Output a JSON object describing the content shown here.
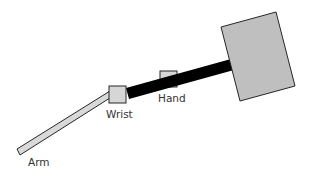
{
  "diagram": {
    "labels": {
      "arm": "Arm",
      "wrist": "Wrist",
      "hand": "Hand"
    },
    "colors": {
      "background": "#ffffff",
      "arm_fill": "#d9d9d9",
      "joint_fill": "#d6d6d6",
      "block_fill": "#bfbfbf",
      "bar_fill": "#000000",
      "stroke": "#262626",
      "text": "#333333"
    }
  }
}
